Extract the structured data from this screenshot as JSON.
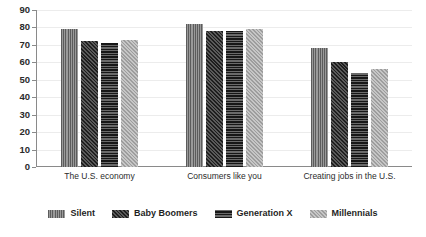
{
  "chart_data": {
    "type": "bar",
    "title": "",
    "subtitle": "",
    "xlabel": "",
    "ylabel": "",
    "ylim": [
      0,
      90
    ],
    "ytick_step": 10,
    "yticks": [
      "90",
      "80",
      "70",
      "60",
      "50",
      "40",
      "30",
      "20",
      "10",
      "0"
    ],
    "grid": true,
    "legend_position": "bottom",
    "categories": [
      "The U.S. economy",
      "Consumers like you",
      "Creating jobs in the U.S."
    ],
    "series": [
      {
        "name": "Silent",
        "pattern": "vertical-lines",
        "color": "#6e6e6e",
        "values": [
          79,
          82,
          68
        ]
      },
      {
        "name": "Baby Boomers",
        "pattern": "diagonal-hatch-dark",
        "color": "#2f2f2f",
        "values": [
          72,
          78,
          60
        ]
      },
      {
        "name": "Generation X",
        "pattern": "horizontal-lines",
        "color": "#303030",
        "values": [
          71,
          78,
          54
        ]
      },
      {
        "name": "Millennials",
        "pattern": "diagonal-hatch-light",
        "color": "#b0b0b0",
        "values": [
          73,
          79,
          56
        ]
      }
    ]
  }
}
